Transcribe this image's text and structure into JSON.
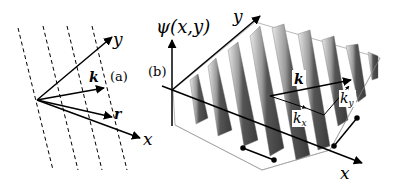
{
  "panel_a": {
    "label": "(a)",
    "axis_x": "x",
    "axis_y": "y",
    "vector_k": "k",
    "vector_r": "r"
  },
  "panel_b": {
    "label": "(b)",
    "axis_z": "ψ(x,y)",
    "axis_x": "x",
    "axis_y": "y",
    "vector_k": "k",
    "component_kx": "k",
    "component_kx_sub": "x",
    "component_ky": "k",
    "component_ky_sub": "y"
  }
}
